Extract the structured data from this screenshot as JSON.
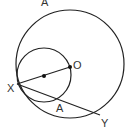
{
  "diagram": {
    "labels": {
      "top_a": "A",
      "o": "O",
      "x": "X",
      "lower_a": "A",
      "y": "Y"
    },
    "colors": {
      "stroke": "#222222",
      "text": "#333333",
      "background": "#ffffff"
    },
    "shapes": {
      "large_circle": {
        "cx": 70,
        "cy": 64,
        "r": 54
      },
      "small_circle": {
        "cx": 44,
        "cy": 75,
        "r": 27
      },
      "point_o": {
        "x": 70,
        "y": 67
      },
      "small_center": {
        "x": 44,
        "y": 76
      },
      "point_x": {
        "x": 17,
        "y": 84
      },
      "point_y": {
        "x": 100,
        "y": 115
      },
      "point_a_lower": {
        "x": 59,
        "y": 99
      }
    }
  }
}
